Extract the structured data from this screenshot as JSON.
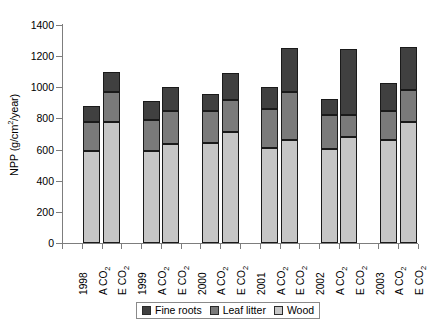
{
  "chart_data": {
    "type": "bar",
    "subtype": "stacked",
    "title": "",
    "xlabel": "",
    "ylabel": "NPP (g/cm2/year)",
    "ylabel_display": "NPP (g/cm²/year)",
    "ylim": [
      0,
      1400
    ],
    "ytick_step": 200,
    "yticks": [
      0,
      200,
      400,
      600,
      800,
      1000,
      1200,
      1400
    ],
    "grid": false,
    "legend_position": "bottom",
    "group_labels": [
      "1998",
      "1999",
      "2000",
      "2001",
      "2002",
      "2003"
    ],
    "categories": [
      "A CO2",
      "E CO2",
      "A CO2",
      "E CO2",
      "A CO2",
      "E CO2",
      "A CO2",
      "E CO2",
      "A CO2",
      "E CO2",
      "A CO2",
      "E CO2"
    ],
    "series": [
      {
        "name": "Wood",
        "color": "#c6c6c6",
        "values": [
          590,
          780,
          590,
          635,
          645,
          710,
          610,
          660,
          605,
          680,
          660,
          775
        ]
      },
      {
        "name": "Leaf litter",
        "color": "#7a7a7a",
        "values": [
          190,
          190,
          200,
          215,
          205,
          210,
          250,
          310,
          215,
          140,
          190,
          205
        ]
      },
      {
        "name": "Fine roots",
        "color": "#404040",
        "values": [
          100,
          130,
          125,
          150,
          105,
          170,
          140,
          280,
          105,
          425,
          180,
          280
        ]
      }
    ],
    "totals": [
      880,
      1100,
      915,
      1000,
      955,
      1090,
      1000,
      1250,
      925,
      1245,
      1030,
      1260
    ],
    "legend": [
      {
        "label": "Fine roots",
        "color": "#404040"
      },
      {
        "label": "Leaf litter",
        "color": "#7a7a7a"
      },
      {
        "label": "Wood",
        "color": "#c6c6c6"
      }
    ]
  },
  "axis": {
    "y_title_prefix": "NPP (g/cm",
    "y_title_sup": "2",
    "y_title_suffix": "/year)",
    "ytick_labels": [
      "1400",
      "1200",
      "1000",
      "800",
      "600",
      "400",
      "200",
      "0"
    ]
  },
  "xaxis": {
    "tick_labels": [
      {
        "text": "1998",
        "type": "year"
      },
      {
        "text": "A CO",
        "sub": "2",
        "type": "treatment"
      },
      {
        "text": "E CO",
        "sub": "2",
        "type": "treatment"
      },
      {
        "text": "1999",
        "type": "year"
      },
      {
        "text": "A CO",
        "sub": "2",
        "type": "treatment"
      },
      {
        "text": "E CO",
        "sub": "2",
        "type": "treatment"
      },
      {
        "text": "2000",
        "type": "year"
      },
      {
        "text": "A CO",
        "sub": "2",
        "type": "treatment"
      },
      {
        "text": "E CO",
        "sub": "2",
        "type": "treatment"
      },
      {
        "text": "2001",
        "type": "year"
      },
      {
        "text": "A CO",
        "sub": "2",
        "type": "treatment"
      },
      {
        "text": "E CO",
        "sub": "2",
        "type": "treatment"
      },
      {
        "text": "2002",
        "type": "year"
      },
      {
        "text": "A CO",
        "sub": "2",
        "type": "treatment"
      },
      {
        "text": "E CO",
        "sub": "2",
        "type": "treatment"
      },
      {
        "text": "2003",
        "type": "year"
      },
      {
        "text": "A CO",
        "sub": "2",
        "type": "treatment"
      },
      {
        "text": "E CO",
        "sub": "2",
        "type": "treatment"
      }
    ]
  },
  "colors": {
    "fine_roots": "#404040",
    "leaf_litter": "#7a7a7a",
    "wood": "#c6c6c6",
    "axis": "#7d7d7d",
    "text": "#000000",
    "background": "#ffffff"
  }
}
